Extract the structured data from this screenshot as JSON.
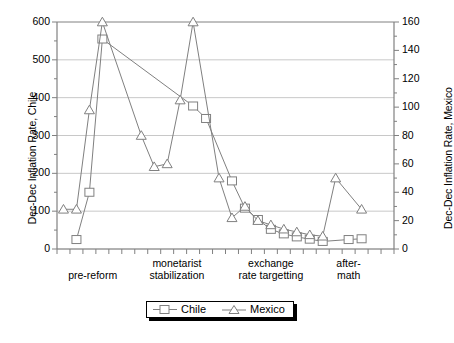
{
  "chart_data": {
    "type": "line",
    "title": "",
    "xlabel": "",
    "categories": [
      "pre-reform",
      "monetarist stabilization",
      "exchange rate targetting",
      "aftermath"
    ],
    "category_label_lines": [
      [
        "",
        "pre-reform"
      ],
      [
        "monetarist",
        "stabilization"
      ],
      [
        "exchange",
        "rate targetting"
      ],
      [
        "after-",
        "math"
      ]
    ],
    "grid": true,
    "legend_position": "bottom-center",
    "axes": {
      "left": {
        "label": "Dec-Dec Inflation Rate, Chile",
        "ylim": [
          0,
          600
        ],
        "ticks": [
          0,
          100,
          200,
          300,
          400,
          500,
          600
        ],
        "minor_step": 50
      },
      "right": {
        "label": "Dec-Dec Inflation Rate, Mexico",
        "ylim": [
          0,
          160
        ],
        "ticks": [
          0,
          20,
          40,
          60,
          80,
          100,
          120,
          140,
          160
        ],
        "minor_step": 10
      }
    },
    "x_index_count": 26,
    "series": [
      {
        "name": "Chile",
        "axis": "left",
        "marker": "square",
        "color": "#808080",
        "x": [
          1,
          2,
          3,
          10,
          11,
          13,
          14,
          15,
          16,
          17,
          18,
          19,
          20,
          22,
          23
        ],
        "values": [
          25,
          150,
          555,
          378,
          345,
          180,
          108,
          78,
          52,
          40,
          32,
          26,
          20,
          25,
          27
        ]
      },
      {
        "name": "Mexico",
        "axis": "right",
        "marker": "triangle",
        "color": "#808080",
        "x": [
          0,
          1,
          2,
          3,
          6,
          7,
          8,
          9,
          10,
          12,
          13,
          14,
          15,
          16,
          17,
          18,
          19,
          20,
          21,
          23
        ],
        "values": [
          28,
          28,
          98,
          160,
          80,
          58,
          60,
          105,
          160,
          50,
          22,
          30,
          20,
          17,
          14,
          12,
          10,
          9,
          50,
          28
        ]
      }
    ]
  },
  "legend": {
    "entries": [
      {
        "label": "Chile",
        "marker": "square-marker-icon"
      },
      {
        "label": "Mexico",
        "marker": "triangle-marker-icon"
      }
    ]
  }
}
